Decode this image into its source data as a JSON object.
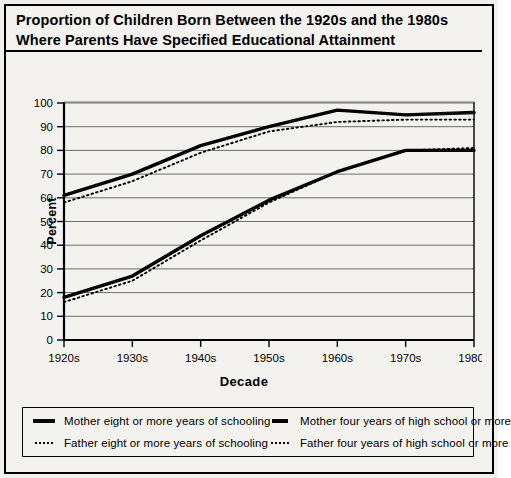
{
  "title": {
    "line1": "Proportion of Children Born Between the 1920s and the 1980s",
    "line2": "Where Parents Have Specified Educational Attainment"
  },
  "legend": {
    "items": [
      {
        "marker": "solid-thick-line-icon",
        "label": "Mother eight or more years of schooling"
      },
      {
        "marker": "solid-thick-line-icon",
        "label": "Mother four years of high school or more"
      },
      {
        "marker": "dotted-line-icon",
        "label": "Father eight or more years of schooling"
      },
      {
        "marker": "dotted-line-icon",
        "label": "Father four years of high school or more"
      }
    ]
  },
  "chart_data": {
    "type": "line",
    "title": "Proportion of Children Born Between the 1920s and the 1980s Where Parents Have Specified Educational Attainment",
    "xlabel": "Decade",
    "ylabel": "Percent",
    "categories": [
      "1920s",
      "1930s",
      "1940s",
      "1950s",
      "1960s",
      "1970s",
      "1980s"
    ],
    "xtick_labels": [
      "1920s",
      "1930s",
      "1940s",
      "1950s",
      "1960s",
      "1970s",
      "1980s"
    ],
    "ytick_labels": [
      "0",
      "10",
      "20",
      "30",
      "40",
      "50",
      "60",
      "70",
      "80",
      "90",
      "100"
    ],
    "ylim": [
      0,
      100
    ],
    "ytick_step": 10,
    "grid": "horizontal",
    "legend_position": "below-plot",
    "series": [
      {
        "name": "Mother eight or more years of schooling",
        "style": "solid",
        "width": "thick",
        "color": "#000000",
        "values": [
          61,
          70,
          82,
          90,
          97,
          95,
          96
        ]
      },
      {
        "name": "Father eight or more years of schooling",
        "style": "dotted",
        "width": "thin",
        "color": "#000000",
        "values": [
          58,
          67,
          79,
          88,
          92,
          93,
          93
        ]
      },
      {
        "name": "Mother four years of high school or more",
        "style": "solid",
        "width": "thick",
        "color": "#000000",
        "values": [
          18,
          27,
          44,
          59,
          71,
          80,
          80
        ]
      },
      {
        "name": "Father four years of high school or more",
        "style": "dotted",
        "width": "thin",
        "color": "#000000",
        "values": [
          16,
          25,
          42,
          58,
          71,
          80,
          81
        ]
      }
    ]
  }
}
